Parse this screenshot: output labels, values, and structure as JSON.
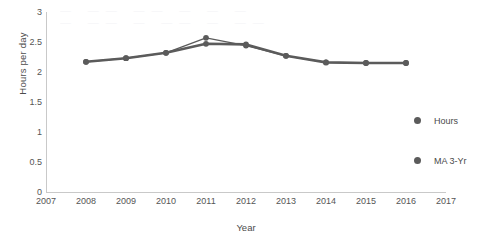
{
  "chart_data": {
    "type": "line",
    "title": "",
    "xlabel": "Year",
    "ylabel": "Hours per day",
    "x": [
      2008,
      2009,
      2010,
      2011,
      2012,
      2013,
      2014,
      2015,
      2016
    ],
    "xlim": [
      2007,
      2017
    ],
    "ylim": [
      0,
      3
    ],
    "x_ticks": [
      "2007",
      "2008",
      "2009",
      "2010",
      "2011",
      "2012",
      "2013",
      "2014",
      "2015",
      "2016",
      "2017"
    ],
    "y_ticks": [
      "0",
      "0.5",
      "1",
      "1.5",
      "2",
      "2.5",
      "3"
    ],
    "grid": false,
    "legend_position": "right",
    "series": [
      {
        "name": "Hours",
        "values": [
          2.17,
          2.23,
          2.32,
          2.57,
          2.44,
          2.27,
          2.16,
          2.15,
          2.15
        ],
        "color": "#5b5b5b",
        "line_width": 1.3,
        "marker": "circle"
      },
      {
        "name": "MA 3-Yr",
        "values": [
          2.17,
          2.23,
          2.32,
          2.47,
          2.46,
          2.27,
          2.16,
          2.15,
          2.15
        ],
        "color": "#5b5b5b",
        "line_width": 2.6,
        "marker": "circle"
      }
    ]
  },
  "legend": {
    "entries": [
      {
        "label": "Hours"
      },
      {
        "label": "MA 3-Yr"
      }
    ]
  },
  "watermark": {
    "line1": "— —— —— — — —",
    "line2": "— —— — —— — ——"
  }
}
